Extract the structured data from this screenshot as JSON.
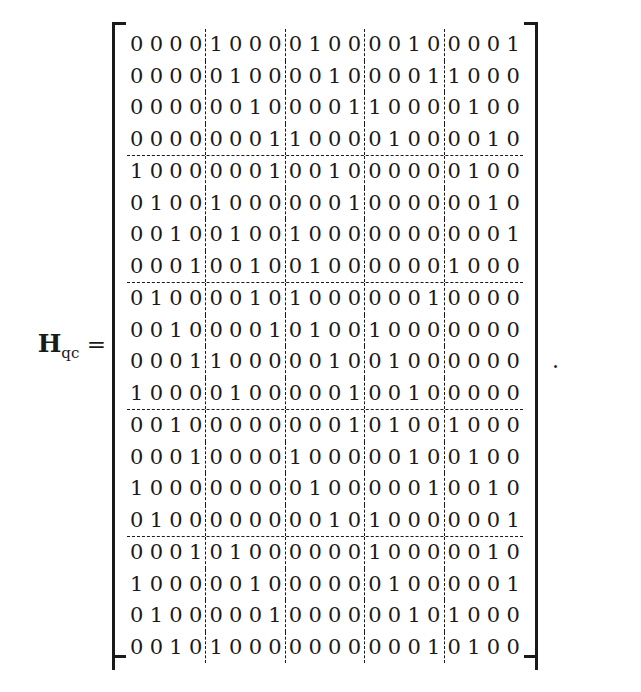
{
  "equation": {
    "label_symbol": "H",
    "label_subscript": "qc",
    "equals_sign": "=",
    "trailing_punctuation": ".",
    "left_bracket": "[",
    "right_bracket": "]"
  },
  "matrix": {
    "rows_total": 20,
    "cols_total": 20,
    "block_rows": 5,
    "block_cols": 5,
    "block_size": 4,
    "separator_style": "dashed",
    "bracket_style": "square",
    "text_color": "#1a1a1a",
    "background_color": "#ffffff",
    "data": [
      [
        0,
        0,
        0,
        0,
        1,
        0,
        0,
        0,
        0,
        1,
        0,
        0,
        0,
        0,
        1,
        0,
        0,
        0,
        0,
        1
      ],
      [
        0,
        0,
        0,
        0,
        0,
        1,
        0,
        0,
        0,
        0,
        1,
        0,
        0,
        0,
        0,
        1,
        1,
        0,
        0,
        0
      ],
      [
        0,
        0,
        0,
        0,
        0,
        0,
        1,
        0,
        0,
        0,
        0,
        1,
        1,
        0,
        0,
        0,
        0,
        1,
        0,
        0
      ],
      [
        0,
        0,
        0,
        0,
        0,
        0,
        0,
        1,
        1,
        0,
        0,
        0,
        0,
        1,
        0,
        0,
        0,
        0,
        1,
        0
      ],
      [
        1,
        0,
        0,
        0,
        0,
        0,
        0,
        1,
        0,
        0,
        1,
        0,
        0,
        0,
        0,
        0,
        0,
        1,
        0,
        0
      ],
      [
        0,
        1,
        0,
        0,
        1,
        0,
        0,
        0,
        0,
        0,
        0,
        1,
        0,
        0,
        0,
        0,
        0,
        0,
        1,
        0
      ],
      [
        0,
        0,
        1,
        0,
        0,
        1,
        0,
        0,
        1,
        0,
        0,
        0,
        0,
        0,
        0,
        0,
        0,
        0,
        0,
        1
      ],
      [
        0,
        0,
        0,
        1,
        0,
        0,
        1,
        0,
        0,
        1,
        0,
        0,
        0,
        0,
        0,
        0,
        1,
        0,
        0,
        0
      ],
      [
        0,
        1,
        0,
        0,
        0,
        0,
        1,
        0,
        1,
        0,
        0,
        0,
        0,
        0,
        0,
        1,
        0,
        0,
        0,
        0
      ],
      [
        0,
        0,
        1,
        0,
        0,
        0,
        0,
        1,
        0,
        1,
        0,
        0,
        1,
        0,
        0,
        0,
        0,
        0,
        0,
        0
      ],
      [
        0,
        0,
        0,
        1,
        1,
        0,
        0,
        0,
        0,
        0,
        1,
        0,
        0,
        1,
        0,
        0,
        0,
        0,
        0,
        0
      ],
      [
        1,
        0,
        0,
        0,
        0,
        1,
        0,
        0,
        0,
        0,
        0,
        1,
        0,
        0,
        1,
        0,
        0,
        0,
        0,
        0
      ],
      [
        0,
        0,
        1,
        0,
        0,
        0,
        0,
        0,
        0,
        0,
        0,
        1,
        0,
        1,
        0,
        0,
        1,
        0,
        0,
        0
      ],
      [
        0,
        0,
        0,
        1,
        0,
        0,
        0,
        0,
        1,
        0,
        0,
        0,
        0,
        0,
        1,
        0,
        0,
        1,
        0,
        0
      ],
      [
        1,
        0,
        0,
        0,
        0,
        0,
        0,
        0,
        0,
        1,
        0,
        0,
        0,
        0,
        0,
        1,
        0,
        0,
        1,
        0
      ],
      [
        0,
        1,
        0,
        0,
        0,
        0,
        0,
        0,
        0,
        0,
        1,
        0,
        1,
        0,
        0,
        0,
        0,
        0,
        0,
        1
      ],
      [
        0,
        0,
        0,
        1,
        0,
        1,
        0,
        0,
        0,
        0,
        0,
        0,
        1,
        0,
        0,
        0,
        0,
        0,
        1,
        0
      ],
      [
        1,
        0,
        0,
        0,
        0,
        0,
        1,
        0,
        0,
        0,
        0,
        0,
        0,
        1,
        0,
        0,
        0,
        0,
        0,
        1
      ],
      [
        0,
        1,
        0,
        0,
        0,
        0,
        0,
        1,
        0,
        0,
        0,
        0,
        0,
        0,
        1,
        0,
        1,
        0,
        0,
        0
      ],
      [
        0,
        0,
        1,
        0,
        1,
        0,
        0,
        0,
        0,
        0,
        0,
        0,
        0,
        0,
        0,
        1,
        0,
        1,
        0,
        0
      ]
    ]
  }
}
